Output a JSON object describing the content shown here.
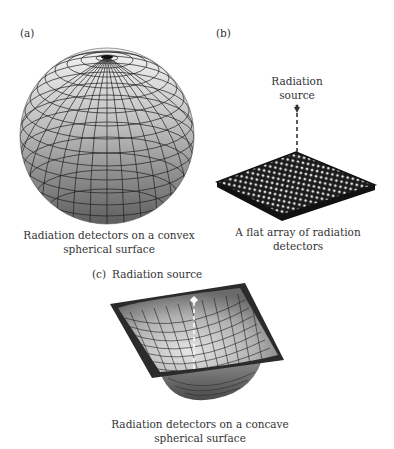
{
  "panels": [
    {
      "id": "a",
      "label": "(a)",
      "caption_line1": "Radiation detectors on a convex",
      "caption_line2": "spherical surface"
    },
    {
      "id": "b",
      "label": "(b)",
      "source_line1": "Radiation",
      "source_line2": "source",
      "caption": "A flat array of radiation detectors"
    },
    {
      "id": "c",
      "label": "(c)",
      "source_label": "Radiation source",
      "caption_line1": "Radiation detectors on a concave",
      "caption_line2": "spherical surface"
    }
  ],
  "colors": {
    "sphere_light": "#f2f2f2",
    "sphere_dark": "#5a5a5a",
    "grid_line": "#1a1a1a",
    "array_base": "#1c1c1c",
    "detector_dot": "#e8e8e8",
    "plate_dark": "#2a2a2a"
  }
}
